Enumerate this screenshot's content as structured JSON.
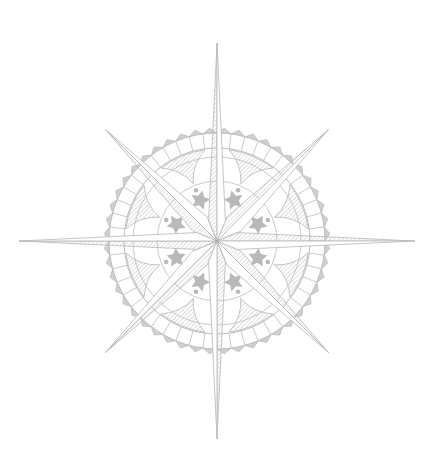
{
  "image": {
    "title": "Compass rose illustration",
    "description": "Eight-pointed hatched compass rose over a scalloped decorative ring with star ornaments"
  },
  "rose": {
    "line_color": "#bdbdbd",
    "fill_color": "#b9b9b9",
    "hatch_color": "#c4c4c4",
    "background": "#ffffff",
    "points": [
      {
        "name": "north",
        "direction_deg": 0,
        "type": "major"
      },
      {
        "name": "north-east",
        "direction_deg": 45,
        "type": "minor"
      },
      {
        "name": "east",
        "direction_deg": 90,
        "type": "major"
      },
      {
        "name": "south-east",
        "direction_deg": 135,
        "type": "minor"
      },
      {
        "name": "south",
        "direction_deg": 180,
        "type": "major"
      },
      {
        "name": "south-west",
        "direction_deg": 225,
        "type": "minor"
      },
      {
        "name": "west",
        "direction_deg": 270,
        "type": "major"
      },
      {
        "name": "north-west",
        "direction_deg": 315,
        "type": "minor"
      }
    ],
    "ring": {
      "scallop_count": 48,
      "ornament_count": 8
    }
  }
}
